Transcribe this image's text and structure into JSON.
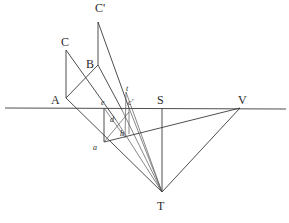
{
  "diagram": {
    "type": "perspective-construction",
    "labels": {
      "C_prime": "C'",
      "C": "C",
      "B": "B",
      "A": "A",
      "e": "e",
      "t": "t",
      "c_prime": "c'",
      "S": "S",
      "V": "V",
      "d": "d",
      "a": "a",
      "b": "b",
      "T": "T"
    },
    "colors": {
      "line": "#3a3a3a",
      "text": "#2a2a2a",
      "background": "#ffffff"
    }
  }
}
